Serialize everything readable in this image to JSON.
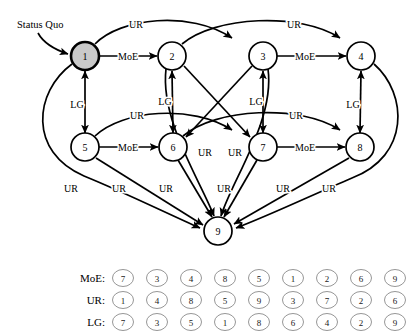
{
  "figure": {
    "annotation": {
      "status_quo_label": "Status Quo"
    },
    "edge_labels": {
      "moe": "MoE",
      "ur": "UR",
      "lg": "LG"
    },
    "nodes": [
      {
        "id": "1",
        "label": "1",
        "cx": 85,
        "cy": 56,
        "r": 14,
        "highlight": true
      },
      {
        "id": "2",
        "label": "2",
        "cx": 172,
        "cy": 56,
        "r": 14,
        "highlight": false
      },
      {
        "id": "3",
        "label": "3",
        "cx": 263,
        "cy": 56,
        "r": 14,
        "highlight": false
      },
      {
        "id": "4",
        "label": "4",
        "cx": 361,
        "cy": 56,
        "r": 14,
        "highlight": false
      },
      {
        "id": "5",
        "label": "5",
        "cx": 85,
        "cy": 147,
        "r": 14,
        "highlight": false
      },
      {
        "id": "6",
        "label": "6",
        "cx": 173,
        "cy": 147,
        "r": 14,
        "highlight": false
      },
      {
        "id": "7",
        "label": "7",
        "cx": 263,
        "cy": 147,
        "r": 14,
        "highlight": false
      },
      {
        "id": "8",
        "label": "8",
        "cx": 360,
        "cy": 147,
        "r": 14,
        "highlight": false
      },
      {
        "id": "9",
        "label": "9",
        "cx": 218,
        "cy": 231,
        "r": 14,
        "highlight": false
      }
    ],
    "edges": [
      {
        "from": "1",
        "to": "2",
        "label": "MoE"
      },
      {
        "from": "3",
        "to": "4",
        "label": "MoE"
      },
      {
        "from": "5",
        "to": "6",
        "label": "MoE"
      },
      {
        "from": "7",
        "to": "8",
        "label": "MoE"
      },
      {
        "from": "1",
        "to": "3",
        "label": "UR"
      },
      {
        "from": "2",
        "to": "4",
        "label": "UR"
      },
      {
        "from": "5",
        "to": "7",
        "label": "UR"
      },
      {
        "from": "6",
        "to": "8",
        "label": "UR"
      },
      {
        "from": "1",
        "to": "5",
        "label": "LG",
        "bidirectional": true
      },
      {
        "from": "2",
        "to": "6",
        "label": "LG",
        "bidirectional": true
      },
      {
        "from": "3",
        "to": "7",
        "label": "LG",
        "bidirectional": true
      },
      {
        "from": "4",
        "to": "8",
        "label": "LG",
        "bidirectional": true
      },
      {
        "from": "2",
        "to": "7",
        "label": ""
      },
      {
        "from": "3",
        "to": "6",
        "label": ""
      },
      {
        "from": "1",
        "to": "9",
        "label": "UR"
      },
      {
        "from": "2",
        "to": "9",
        "label": "UR"
      },
      {
        "from": "3",
        "to": "9",
        "label": "UR"
      },
      {
        "from": "4",
        "to": "9",
        "label": "UR"
      },
      {
        "from": "5",
        "to": "9",
        "label": "UR"
      },
      {
        "from": "6",
        "to": "9",
        "label": "UR"
      },
      {
        "from": "7",
        "to": "9",
        "label": "UR"
      },
      {
        "from": "8",
        "to": "9",
        "label": "UR"
      }
    ]
  },
  "legend": {
    "rows": [
      {
        "name": "MoE",
        "label": "MoE:",
        "values": [
          "7",
          "3",
          "4",
          "8",
          "5",
          "1",
          "2",
          "6",
          "9"
        ]
      },
      {
        "name": "UR",
        "label": "UR:",
        "values": [
          "1",
          "4",
          "8",
          "5",
          "9",
          "3",
          "7",
          "2",
          "6"
        ]
      },
      {
        "name": "LG",
        "label": "LG:",
        "values": [
          "7",
          "3",
          "5",
          "1",
          "8",
          "6",
          "4",
          "2",
          "9"
        ]
      }
    ]
  },
  "chart_data": {
    "type": "diagram",
    "title": "",
    "node_count": 9,
    "edge_types": [
      "MoE",
      "UR",
      "LG"
    ]
  }
}
